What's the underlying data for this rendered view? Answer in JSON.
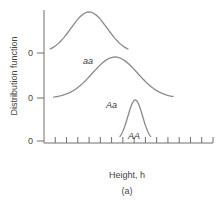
{
  "chart_data": {
    "type": "line",
    "title": "",
    "panel_label": "(a)",
    "xlabel": "Height, h",
    "ylabel": "Distribution function",
    "x_tick_count": 15,
    "x_tick_labels": [],
    "y_offset_labels": [
      "0",
      "0",
      "0"
    ],
    "grid": false,
    "legend": "none",
    "series": [
      {
        "name": "aa",
        "label": "aa",
        "mean": 4.0,
        "sd": 1.6,
        "peak": 1.0,
        "x_range": [
          0.5,
          7.5
        ]
      },
      {
        "name": "Aa",
        "label": "Aa",
        "mean": 6.3,
        "sd": 2.0,
        "peak": 1.0,
        "x_range": [
          0.8,
          11.5
        ]
      },
      {
        "name": "AA",
        "label": "AA",
        "mean": 8.1,
        "sd": 0.65,
        "peak": 1.0,
        "x_range": [
          6.7,
          9.5
        ]
      }
    ],
    "xlim": [
      0,
      15
    ]
  }
}
